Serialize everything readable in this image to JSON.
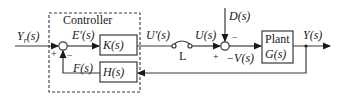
{
  "diagram": {
    "type": "feedback control block diagram",
    "controller_label": "Controller",
    "signals": {
      "reference": "Y_r(s)",
      "reference_main": "Y",
      "reference_sub": "r",
      "error": "E'(s)",
      "feedback": "F(s)",
      "controller_output": "U'(s)",
      "plant_input": "U(s)",
      "disturbance": "D(s)",
      "junction2_output": "−V(s)",
      "output": "Y(s)"
    },
    "blocks": {
      "controller": "K(s)",
      "sensor": "H(s)",
      "plant_title": "Plant",
      "plant": "G(s)"
    },
    "switch_label": "L",
    "signs": {
      "j1_reference": "+",
      "j1_feedback": "−",
      "j2_input": "+",
      "j2_disturbance": "−"
    }
  }
}
